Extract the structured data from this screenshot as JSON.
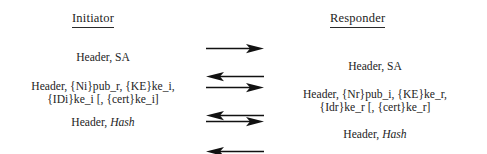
{
  "figure": {
    "type": "protocol-message-sequence-diagram",
    "columns": {
      "left_heading": "Initiator",
      "right_heading": "Responder"
    },
    "exchanges": [
      {
        "id": "exchange-1",
        "initiator_lines": [
          "Header, SA"
        ],
        "responder_lines": [
          "Header, SA"
        ],
        "arrows": [
          "right",
          "left"
        ]
      },
      {
        "id": "exchange-2",
        "initiator_lines": [
          "Header, {Ni}pub_r, {KE}ke_i,",
          "{IDi}ke_i [, {cert}ke_i]"
        ],
        "responder_lines": [
          "Header, {Nr}pub_i, {KE}ke_r,",
          "{Idr}ke_r [, {cert}ke_r]"
        ],
        "arrows": [
          "right",
          "left"
        ]
      },
      {
        "id": "exchange-3",
        "initiator_lines": [
          "Header, ",
          "Hash"
        ],
        "responder_lines": [
          "Header, ",
          "Hash"
        ],
        "arrows": [
          "right",
          "left"
        ]
      }
    ],
    "messages": {
      "init_1_line1": "Header, SA",
      "resp_1_line1": "Header, SA",
      "init_2_line1": "Header, {Ni}pub_r, {KE}ke_i,",
      "init_2_line2": "{IDi}ke_i [, {cert}ke_i]",
      "resp_2_line1": "Header, {Nr}pub_i, {KE}ke_r,",
      "resp_2_line2": "{Idr}ke_r [, {cert}ke_r]",
      "init_3_prefix": "Header, ",
      "init_3_italic": "Hash",
      "resp_3_prefix": "Header, ",
      "resp_3_italic": "Hash"
    },
    "arrow_labels": {
      "right": "right-arrow",
      "left": "left-arrow"
    },
    "colors": {
      "text": "#242424",
      "heading": "#232323",
      "arrow": "#111111",
      "background": "#ffffff"
    }
  }
}
